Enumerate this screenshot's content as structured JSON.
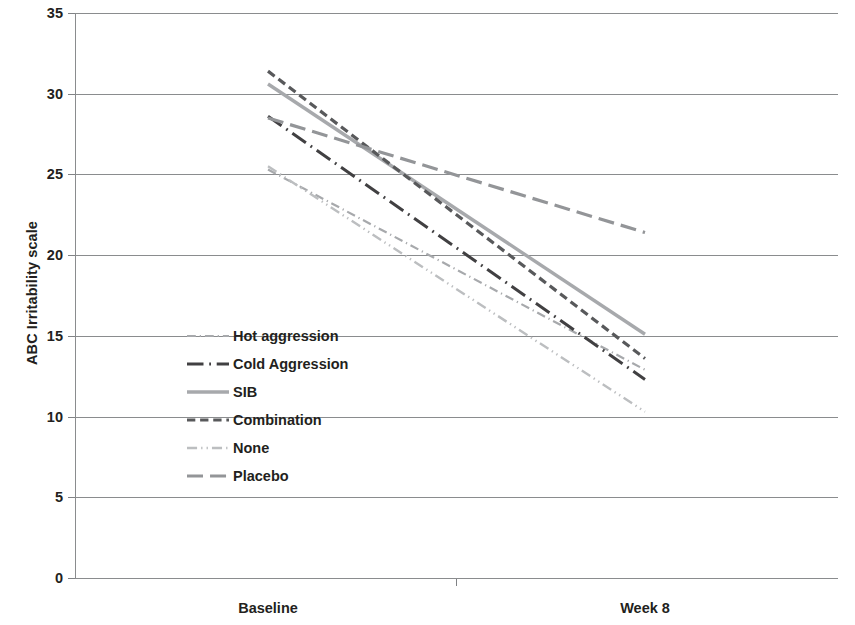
{
  "chart_data": {
    "type": "line",
    "title": "",
    "xlabel": "",
    "ylabel": "ABC Irritability scale",
    "categories": [
      "Baseline",
      "Week 8"
    ],
    "x_tick_labels": [
      "Baseline",
      "Week 8"
    ],
    "y_tick_labels": [
      "0",
      "5",
      "10",
      "15",
      "20",
      "25",
      "30",
      "35"
    ],
    "y_tick_values": [
      0,
      5,
      10,
      15,
      20,
      25,
      30,
      35
    ],
    "ylim": [
      0,
      35
    ],
    "grid": "horizontal",
    "legend_position": "inside-lower-left",
    "series": [
      {
        "name": "Hot aggression",
        "values": [
          25.3,
          12.9
        ],
        "color": "#a7a9ac",
        "style": "dash-dot",
        "width": 2.2
      },
      {
        "name": "Cold Aggression",
        "values": [
          28.6,
          12.3
        ],
        "color": "#414042",
        "style": "long-dash-dot",
        "width": 3.0
      },
      {
        "name": "SIB",
        "values": [
          30.6,
          15.1
        ],
        "color": "#a7a9ac",
        "style": "solid",
        "width": 3.4
      },
      {
        "name": "Combination",
        "values": [
          31.4,
          13.6
        ],
        "color": "#58595b",
        "style": "dashed",
        "width": 3.2
      },
      {
        "name": "None",
        "values": [
          25.5,
          10.3
        ],
        "color": "#bcbec0",
        "style": "dash-dot-dot",
        "width": 2.4
      },
      {
        "name": "Placebo",
        "values": [
          28.5,
          21.4
        ],
        "color": "#939598",
        "style": "long-dash",
        "width": 3.2
      }
    ]
  },
  "axes": {
    "y_title": "ABC Irritability scale"
  },
  "legend": {
    "entries": [
      {
        "label": "Hot aggression"
      },
      {
        "label": "Cold Aggression"
      },
      {
        "label": "SIB"
      },
      {
        "label": "Combination"
      },
      {
        "label": "None"
      },
      {
        "label": "Placebo"
      }
    ]
  },
  "colors": {
    "axis": "#8a8c8e",
    "grid": "#8a8c8e",
    "text": "#231f20",
    "background": "#ffffff"
  }
}
